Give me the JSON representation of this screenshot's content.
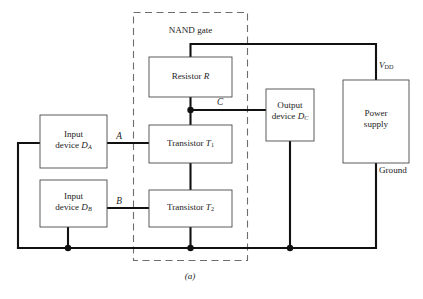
{
  "figure": {
    "caption": "(a)",
    "group_label": "NAND gate",
    "blocks": {
      "resistor": {
        "line1": "Resistor",
        "symbol": "R"
      },
      "transistor1": {
        "line1": "Transistor",
        "symbol": "T",
        "sub": "1"
      },
      "transistor2": {
        "line1": "Transistor",
        "symbol": "T",
        "sub": "2"
      },
      "input_a": {
        "line1": "Input",
        "line2": "device",
        "symbol": "D",
        "sub": "A"
      },
      "input_b": {
        "line1": "Input",
        "line2": "device",
        "symbol": "D",
        "sub": "B"
      },
      "output_c": {
        "line1": "Output",
        "line2": "device",
        "symbol": "D",
        "sub": "C"
      },
      "power": {
        "line1": "Power",
        "line2": "supply"
      }
    },
    "signals": {
      "a": "A",
      "b": "B",
      "c": "C"
    },
    "rails": {
      "supply": {
        "symbol": "V",
        "sub": "DD"
      },
      "ground": "Ground"
    },
    "colors": {
      "wire": "#111111",
      "box_stroke": "#4a4a4a",
      "dash_stroke": "#6d6d6d",
      "background": "#ffffff"
    }
  }
}
